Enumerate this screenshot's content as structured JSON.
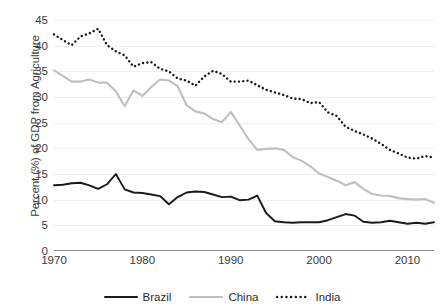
{
  "chart_data": {
    "type": "line",
    "title": "",
    "xlabel": "",
    "ylabel": "Percent (%) of GDP from Agriculture",
    "xlim": [
      1970,
      2013
    ],
    "ylim": [
      0,
      45
    ],
    "ytick_values": [
      0,
      5,
      10,
      15,
      20,
      25,
      30,
      35,
      40,
      45
    ],
    "ytick_labels": [
      "0",
      "5",
      "10",
      "15",
      "20",
      "25",
      "30",
      "35",
      "40",
      "45"
    ],
    "xtick_values": [
      1970,
      1980,
      1990,
      2000,
      2010
    ],
    "xtick_labels": [
      "1970",
      "1980",
      "1990",
      "2000",
      "2010"
    ],
    "grid": true,
    "legend_position": "bottom",
    "x": [
      1970,
      1971,
      1972,
      1973,
      1974,
      1975,
      1976,
      1977,
      1978,
      1979,
      1980,
      1981,
      1982,
      1983,
      1984,
      1985,
      1986,
      1987,
      1988,
      1989,
      1990,
      1991,
      1992,
      1993,
      1994,
      1995,
      1996,
      1997,
      1998,
      1999,
      2000,
      2001,
      2002,
      2003,
      2004,
      2005,
      2006,
      2007,
      2008,
      2009,
      2010,
      2011,
      2012,
      2013
    ],
    "series": [
      {
        "name": "Brazil",
        "color": "#1a1a1a",
        "style": "solid",
        "values": [
          12.8,
          12.9,
          13.2,
          13.3,
          12.8,
          12.1,
          13.0,
          15.0,
          12.0,
          11.4,
          11.3,
          11.0,
          10.7,
          9.1,
          10.5,
          11.4,
          11.6,
          11.5,
          11.0,
          10.5,
          10.6,
          9.9,
          10.0,
          10.8,
          7.4,
          5.8,
          5.6,
          5.5,
          5.6,
          5.6,
          5.6,
          6.0,
          6.6,
          7.2,
          6.9,
          5.7,
          5.5,
          5.6,
          5.9,
          5.6,
          5.3,
          5.5,
          5.3,
          5.6
        ]
      },
      {
        "name": "China",
        "color": "#bfbfbf",
        "style": "solid",
        "values": [
          35.2,
          34.1,
          33.0,
          33.0,
          33.4,
          32.8,
          32.8,
          31.1,
          28.2,
          31.3,
          30.2,
          31.9,
          33.4,
          33.2,
          32.1,
          28.4,
          27.2,
          26.8,
          25.7,
          25.1,
          27.1,
          24.5,
          21.8,
          19.7,
          19.9,
          20.0,
          19.7,
          18.3,
          17.6,
          16.5,
          15.1,
          14.4,
          13.7,
          12.8,
          13.4,
          12.1,
          11.1,
          10.8,
          10.7,
          10.3,
          10.1,
          10.0,
          10.1,
          9.4
        ]
      },
      {
        "name": "India",
        "color": "#1a1a1a",
        "style": "dotted",
        "values": [
          42.2,
          41.1,
          40.1,
          41.8,
          42.4,
          43.3,
          40.1,
          38.9,
          38.1,
          35.9,
          36.6,
          36.8,
          35.5,
          35.0,
          33.6,
          33.2,
          32.2,
          34.0,
          35.1,
          34.5,
          33.0,
          33.0,
          33.2,
          32.3,
          31.4,
          30.9,
          30.4,
          29.7,
          29.6,
          28.8,
          29.0,
          27.0,
          26.3,
          24.2,
          23.4,
          22.7,
          21.9,
          20.9,
          19.7,
          19.0,
          18.2,
          18.0,
          18.5,
          18.2
        ]
      }
    ]
  },
  "legend": {
    "items": [
      {
        "label": "Brazil"
      },
      {
        "label": "China"
      },
      {
        "label": "India"
      }
    ]
  }
}
